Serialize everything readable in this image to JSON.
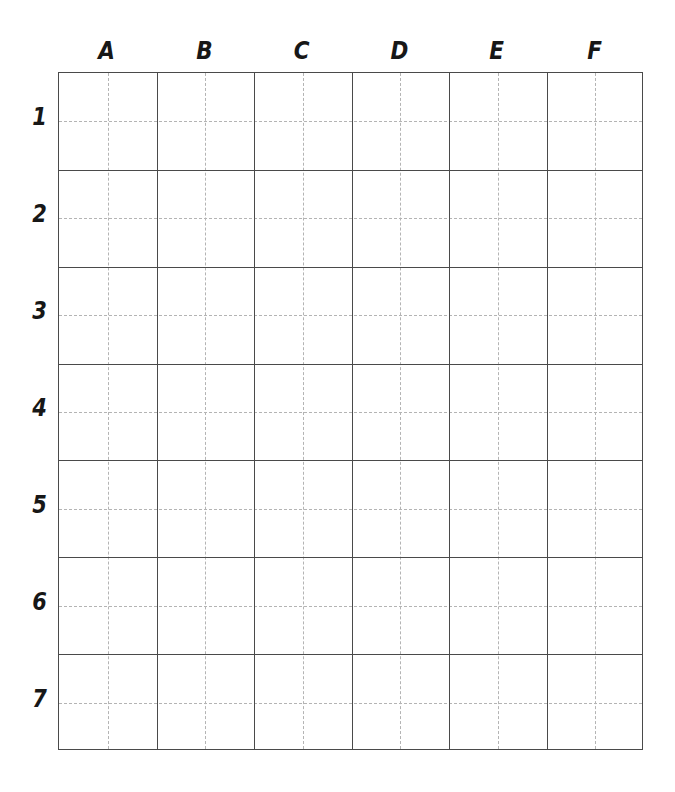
{
  "sheet": {
    "name": "blank-coordinate-grid",
    "background_color": "#ffffff",
    "line_color": "#4a4a4a",
    "guide_line_color": "#b4b4b4",
    "label_color": "#171717"
  },
  "grid": {
    "column_count": 6,
    "row_count": 7,
    "cell_subdivision": "quadrant",
    "column_headers": [
      "A",
      "B",
      "C",
      "D",
      "E",
      "F"
    ],
    "row_headers": [
      "1",
      "2",
      "3",
      "4",
      "5",
      "6",
      "7"
    ],
    "cells": [
      [
        "",
        "",
        "",
        "",
        "",
        ""
      ],
      [
        "",
        "",
        "",
        "",
        "",
        ""
      ],
      [
        "",
        "",
        "",
        "",
        "",
        ""
      ],
      [
        "",
        "",
        "",
        "",
        "",
        ""
      ],
      [
        "",
        "",
        "",
        "",
        "",
        ""
      ],
      [
        "",
        "",
        "",
        "",
        "",
        ""
      ],
      [
        "",
        "",
        "",
        "",
        "",
        ""
      ]
    ]
  }
}
